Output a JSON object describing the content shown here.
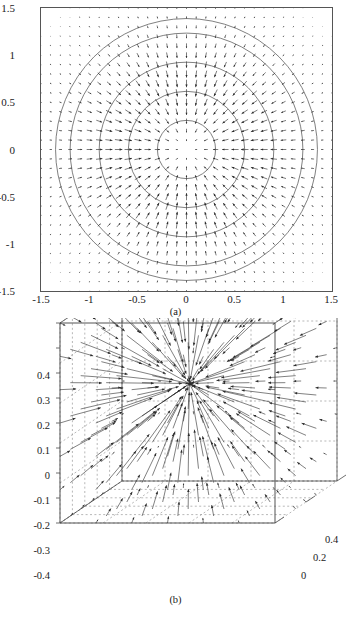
{
  "figure": {
    "panels": [
      {
        "caption": "(a)",
        "type": "2d-quiver",
        "xticks": [
          "-1.5",
          "-1",
          "-0.5",
          "0",
          "0.5",
          "1",
          "1.5"
        ],
        "yticks": [
          "1.5",
          "1",
          "0.5",
          "0",
          "-0.5",
          "-1",
          "-1.5"
        ]
      },
      {
        "caption": "(b)",
        "type": "3d-quiver",
        "zticks": [
          "0.4",
          "0.3",
          "0.2",
          "0.1",
          "0",
          "-0.1",
          "-0.2",
          "-0.3",
          "-0.4"
        ],
        "depthticks": [
          "0.4",
          "0.2",
          "0"
        ]
      }
    ]
  },
  "chart_data": [
    {
      "type": "scatter",
      "subtype": "quiver-vector-field",
      "title": "",
      "subtitle": "",
      "caption": "(a)",
      "xlabel": "",
      "ylabel": "",
      "xlim": [
        -1.5,
        1.5
      ],
      "ylim": [
        -1.5,
        1.5
      ],
      "xticks": [
        -1.5,
        -1,
        -0.5,
        0,
        0.5,
        1,
        1.5
      ],
      "yticks": [
        -1.5,
        -1,
        -0.5,
        0,
        0.5,
        1,
        1.5
      ],
      "xticklabels": [
        "-1.5",
        "-1",
        "-0.5",
        "0",
        "0.5",
        "1",
        "1.5"
      ],
      "yticklabels": [
        "-1.5",
        "-1",
        "-0.5",
        "0",
        "0.5",
        "1",
        "1.5"
      ],
      "grid": false,
      "legend": null,
      "field_description": "Radially inward-pointing planar vector field on a regular Cartesian grid; arrow magnitude peaks at intermediate radius and decays toward the centre and toward the corners.",
      "vector_field": {
        "grid_spacing": 0.1,
        "grid_nx": 31,
        "grid_ny": 31,
        "direction": "inward-radial",
        "magnitude_profile": "peaks near r = 0.55, vanishes at r = 0 and decays for r > 1.1"
      },
      "contours": {
        "shape": "circle",
        "center": [
          0,
          0
        ],
        "radii": [
          0.3,
          0.6,
          0.9,
          1.2,
          1.35
        ],
        "linestyle": "solid",
        "color": "#555555"
      },
      "annotations": []
    },
    {
      "type": "scatter",
      "subtype": "quiver3-vector-field",
      "title": "",
      "subtitle": "",
      "caption": "(b)",
      "xlabel": "",
      "ylabel": "",
      "zlabel": "",
      "zticks": [
        -0.4,
        -0.3,
        -0.2,
        -0.1,
        0,
        0.1,
        0.2,
        0.3,
        0.4
      ],
      "zticklabels": [
        "-0.4",
        "-0.3",
        "-0.2",
        "-0.1",
        "0",
        "0.1",
        "0.2",
        "0.3",
        "0.4"
      ],
      "depthticks": [
        0,
        0.2,
        0.4
      ],
      "depthticklabels": [
        "0",
        "0.2",
        "0.4"
      ],
      "grid": true,
      "gridstyle": "dashed",
      "box": "3d perspective wireframe with dashed grid on back walls and floor",
      "legend": null,
      "field_description": "Three-dimensional vector field converging on a single interior sink located slightly above and left of the box centre; arrows are longest at mid-distance from the sink and shrink near the walls.",
      "vector_field": {
        "direction": "inward-radial toward interior point",
        "sink_location_zvalue": 0.12,
        "magnitude_profile": "largest at intermediate radius from the sink"
      },
      "annotations": []
    }
  ]
}
